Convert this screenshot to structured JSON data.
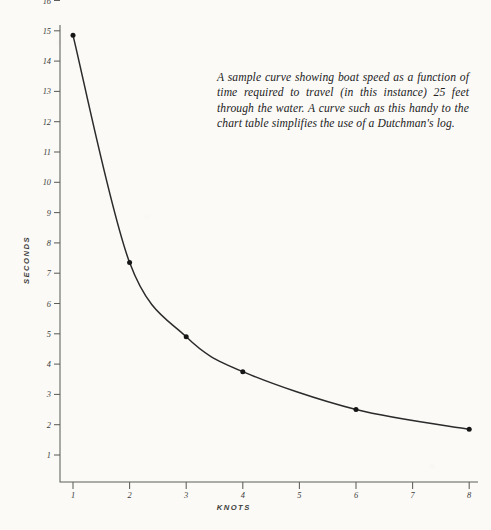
{
  "figure": {
    "background_color": "#fbfaf7",
    "ink_color": "#2b2b2b",
    "axis_color": "#5d5d5a",
    "caption": "A sample curve showing boat speed as a function of time required to travel (in this instance) 25 feet through the water. A curve such as this handy to the chart table simplifies the use of a Dutchman's log."
  },
  "chart_data": {
    "type": "line",
    "title": "",
    "subtitle": "",
    "xlabel": "KNOTS",
    "ylabel": "SECONDS",
    "xlim": [
      0,
      8.2
    ],
    "ylim": [
      0,
      16.4
    ],
    "xticks": [
      1,
      2,
      3,
      4,
      5,
      6,
      7,
      8
    ],
    "xtick_labels": [
      "1",
      "2",
      "3",
      "4",
      "5",
      "6",
      "7",
      "8"
    ],
    "yticks": [
      1,
      2,
      3,
      4,
      5,
      6,
      7,
      8,
      9,
      10,
      11,
      12,
      13,
      14,
      15,
      16
    ],
    "ytick_labels": [
      "1",
      "2",
      "3",
      "4",
      "5",
      "6",
      "7",
      "8",
      "9",
      "10",
      "11",
      "12",
      "13",
      "14",
      "15",
      "16"
    ],
    "grid": false,
    "legend": false,
    "legend_position": "none",
    "marker": "filled-circle",
    "x": [
      1,
      2,
      3,
      4,
      6,
      8
    ],
    "values": [
      14.85,
      7.35,
      4.9,
      3.75,
      2.5,
      1.85
    ],
    "series": [
      {
        "name": "boat speed vs. time for 25 feet",
        "x": [
          1,
          2,
          3,
          4,
          6,
          8
        ],
        "values": [
          14.85,
          7.35,
          4.9,
          3.75,
          2.5,
          1.85
        ]
      }
    ],
    "annotations": [
      "A sample curve showing boat speed as a function of time required to travel (in this instance) 25 feet through the water. A curve such as this handy to the chart table simplifies the use of a Dutchman's log."
    ]
  }
}
